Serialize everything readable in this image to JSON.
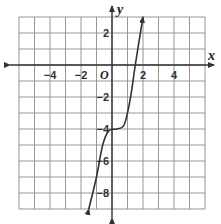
{
  "chart_data": {
    "type": "line",
    "title": "",
    "xlabel": "x",
    "ylabel": "y",
    "origin_label": "O",
    "xlim": [
      -6,
      6
    ],
    "ylim": [
      -9,
      3
    ],
    "grid": true,
    "grid_step": 1,
    "x_ticks": [
      {
        "value": -4,
        "label": "−4"
      },
      {
        "value": -2,
        "label": "−2"
      },
      {
        "value": 2,
        "label": "2"
      },
      {
        "value": 4,
        "label": "4"
      }
    ],
    "y_ticks": [
      {
        "value": 2,
        "label": "2"
      },
      {
        "value": -2,
        "label": "−2"
      },
      {
        "value": -4,
        "label": "−4"
      },
      {
        "value": -6,
        "label": "−6"
      },
      {
        "value": -8,
        "label": "−8"
      }
    ],
    "series": [
      {
        "name": "curve",
        "description": "cubic-shaped curve with flat inflection near y = -4, arrows at both ends",
        "x": [
          -1.5,
          -1.0,
          -0.6,
          -0.2,
          0.3,
          0.8,
          1.2,
          1.5,
          2.0
        ],
        "y": [
          -9,
          -7,
          -5,
          -4.1,
          -4,
          -3.7,
          -2,
          0,
          3
        ]
      }
    ],
    "colors": {
      "grid": "#8a8a8a",
      "axis": "#333333",
      "curve": "#333333"
    }
  }
}
